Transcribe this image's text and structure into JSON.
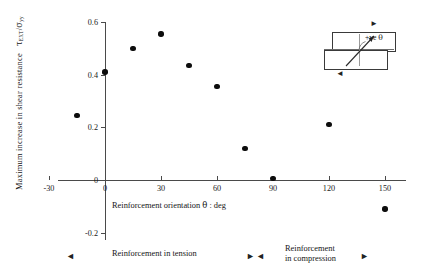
{
  "chart_data": {
    "type": "scatter",
    "title": "",
    "xlabel": "Reinforcement orientation θ : deg",
    "ylabel": "Maximum increase in shear resistance τEXT / σyy",
    "xlim": [
      -30,
      165
    ],
    "ylim": [
      -0.2,
      0.6
    ],
    "xticks": [
      "-30",
      "0",
      "30",
      "60",
      "90",
      "120",
      "150"
    ],
    "xtick_values": [
      -30,
      0,
      30,
      60,
      90,
      120,
      150
    ],
    "yticks": [
      "0.6",
      "0.4",
      "0.2",
      "0",
      "-0.2"
    ],
    "ytick_values": [
      0.6,
      0.4,
      0.2,
      0,
      -0.2
    ],
    "grid": false,
    "legend": "none",
    "marker": "filled-circle",
    "marker_color": "#0d0d0d",
    "axis_color": "#4a4a4a",
    "points": [
      {
        "x": -15,
        "y": 0.245
      },
      {
        "x": 0,
        "y": 0.41
      },
      {
        "x": 15,
        "y": 0.5
      },
      {
        "x": 30,
        "y": 0.555
      },
      {
        "x": 45,
        "y": 0.435
      },
      {
        "x": 60,
        "y": 0.355
      },
      {
        "x": 75,
        "y": 0.12
      },
      {
        "x": 90,
        "y": 0.005
      },
      {
        "x": 120,
        "y": 0.21
      },
      {
        "x": 150,
        "y": -0.11
      }
    ]
  },
  "axis_label": {
    "y_prefix": "Maximum increase in shear resistance",
    "y_symbol_tau": "τ",
    "y_symbol_tau_sub": "EXT",
    "y_slash": "/",
    "y_symbol_sigma": "σ",
    "y_symbol_sigma_sub": "yy",
    "x_text_prefix": "Reinforcement orientation",
    "x_symbol_theta": "θ",
    "x_text_suffix": ": deg"
  },
  "legend": {
    "tension_label": "Reinforcement in tension",
    "compression_label_line1": "Reinforcement",
    "compression_label_line2": "in compression",
    "left_arrow": "◄",
    "right_arrow": "►",
    "mid_arrow_left": "►",
    "mid_arrow_right": "◄"
  },
  "inset": {
    "angle_label_prefix": "+ve",
    "angle_label_symbol": "θ",
    "top_arrow": "►",
    "bottom_arrow": "◄"
  }
}
